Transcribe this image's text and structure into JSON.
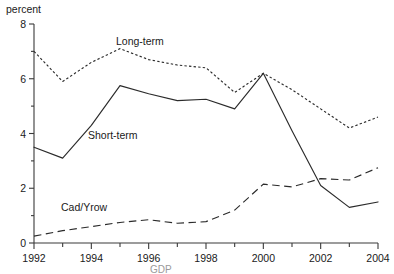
{
  "chart_data": {
    "type": "line",
    "title": "",
    "xlabel": "",
    "ylabel": "percent",
    "xlim": [
      1992,
      2004
    ],
    "ylim": [
      0,
      8
    ],
    "grid": false,
    "legend_position": "inline-annotations",
    "y_ticks": [
      0,
      2,
      4,
      6,
      8
    ],
    "y_tick_labels": [
      "0",
      "2",
      "4",
      "6",
      "8"
    ],
    "y_minor_ticks": [
      1,
      3,
      5,
      7
    ],
    "x_ticks": [
      1992,
      1993,
      1994,
      1995,
      1996,
      1997,
      1998,
      1999,
      2000,
      2001,
      2002,
      2003,
      2004
    ],
    "x_tick_labels": [
      "1992",
      "",
      "1994",
      "",
      "1996",
      "",
      "1998",
      "",
      "2000",
      "",
      "2002",
      "",
      "2004"
    ],
    "x_labeled_ticks": [
      "1992",
      "1994",
      "1996",
      "1998",
      "2000",
      "2002",
      "2004"
    ],
    "x": [
      1992,
      1993,
      1994,
      1995,
      1996,
      1997,
      1998,
      1999,
      2000,
      2001,
      2002,
      2003,
      2004
    ],
    "series": [
      {
        "name": "Long-term",
        "style": "dotted",
        "values": [
          7.0,
          5.9,
          6.6,
          7.1,
          6.7,
          6.5,
          6.4,
          5.5,
          6.2,
          5.6,
          4.9,
          4.2,
          4.6
        ]
      },
      {
        "name": "Short-term",
        "style": "solid",
        "values": [
          3.5,
          3.1,
          4.3,
          5.75,
          5.45,
          5.2,
          5.25,
          4.9,
          6.2,
          4.1,
          2.1,
          1.3,
          1.5
        ]
      },
      {
        "name": "Cad/Yrow",
        "style": "dashed",
        "values": [
          0.25,
          0.45,
          0.6,
          0.75,
          0.85,
          0.72,
          0.78,
          1.2,
          2.15,
          2.05,
          2.35,
          2.3,
          2.75
        ]
      }
    ],
    "annotations": [
      {
        "text": "Long-term",
        "series": "Long-term",
        "x_px": 116,
        "y_px": 45
      },
      {
        "text": "Short-term",
        "series": "Short-term",
        "x_px": 88,
        "y_px": 139
      },
      {
        "text": "Cad/Yrow",
        "series": "Cad/Yrow",
        "x_px": 61,
        "y_px": 211
      }
    ],
    "caption": "GDP"
  }
}
